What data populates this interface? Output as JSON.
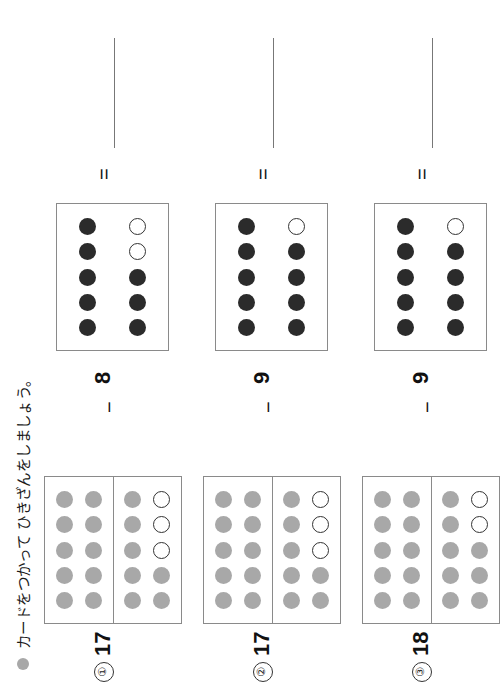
{
  "page": {
    "orientation_deg": -90,
    "background": "#ffffff",
    "title_bullet_color": "#a8a8a8",
    "colors": {
      "gray_dot": "#a8a8a8",
      "dark_dot": "#2b2b2b",
      "empty_dot_border": "#333333",
      "card_border": "#8a8a8a",
      "answer_line": "#777777"
    }
  },
  "header": {
    "title": "カードをつかって ひきざんをしましょう。",
    "bullet_icon": "filled-circle-icon"
  },
  "symbols": {
    "minus": "−",
    "equals": "=",
    "answer_blank": ""
  },
  "problems": [
    {
      "index_label": "①",
      "minuend_label": "17",
      "subtrahend_label": "8",
      "answer": "",
      "minuend_card": {
        "frames": [
          {
            "name": "tens-frame",
            "capacity": 10,
            "filled": 10,
            "fill_color": "gray"
          },
          {
            "name": "ones-frame",
            "capacity": 10,
            "filled": 7,
            "fill_color": "gray"
          }
        ]
      },
      "subtrahend_card": {
        "frames": [
          {
            "name": "subtrahend-frame",
            "capacity": 10,
            "filled": 8,
            "fill_color": "dark"
          }
        ]
      }
    },
    {
      "index_label": "②",
      "minuend_label": "17",
      "subtrahend_label": "9",
      "answer": "",
      "minuend_card": {
        "frames": [
          {
            "name": "tens-frame",
            "capacity": 10,
            "filled": 10,
            "fill_color": "gray"
          },
          {
            "name": "ones-frame",
            "capacity": 10,
            "filled": 7,
            "fill_color": "gray"
          }
        ]
      },
      "subtrahend_card": {
        "frames": [
          {
            "name": "subtrahend-frame",
            "capacity": 10,
            "filled": 9,
            "fill_color": "dark"
          }
        ]
      }
    },
    {
      "index_label": "③",
      "minuend_label": "18",
      "subtrahend_label": "9",
      "answer": "",
      "minuend_card": {
        "frames": [
          {
            "name": "tens-frame",
            "capacity": 10,
            "filled": 10,
            "fill_color": "gray"
          },
          {
            "name": "ones-frame",
            "capacity": 10,
            "filled": 8,
            "fill_color": "gray"
          }
        ]
      },
      "subtrahend_card": {
        "frames": [
          {
            "name": "subtrahend-frame",
            "capacity": 10,
            "filled": 9,
            "fill_color": "dark"
          }
        ]
      }
    }
  ]
}
